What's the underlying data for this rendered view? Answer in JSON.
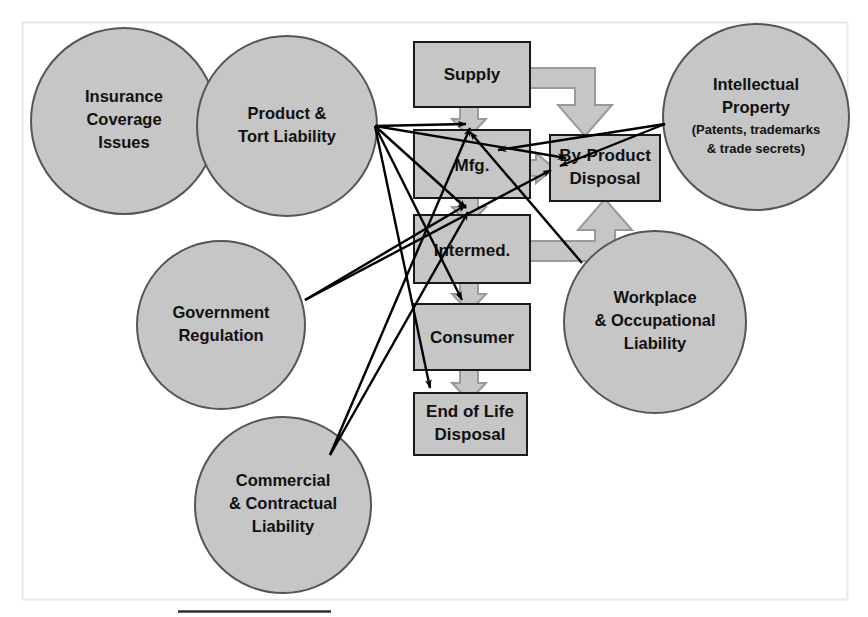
{
  "diagram": {
    "colors": {
      "shape_fill": "#c6c6c6",
      "shape_stroke": "#4d4d4d",
      "box_stroke": "#1a1a1a",
      "arrow_fill": "#c6c6c6",
      "arrow_stroke": "#8c8c8c",
      "line_stroke": "#000000",
      "frame_stroke": "#e4e4e4",
      "background": "#ffffff",
      "text": "#111111"
    },
    "frame": {
      "x": 22,
      "y": 22,
      "width": 826,
      "height": 578
    },
    "footer_rule": {
      "x1": 178,
      "y1": 612,
      "x2": 331,
      "y2": 612
    },
    "circles": [
      {
        "id": "insurance-coverage-issues",
        "lines": [
          "Insurance",
          "Coverage",
          "Issues"
        ],
        "cx": 124,
        "cy": 121,
        "r": 93
      },
      {
        "id": "product-tort-liability",
        "lines": [
          "Product &",
          "Tort Liability"
        ],
        "cx": 287,
        "cy": 126,
        "r": 90
      },
      {
        "id": "intellectual-property",
        "lines": [
          "Intellectual",
          "Property"
        ],
        "sub_lines": [
          "(Patents, trademarks",
          "& trade secrets)"
        ],
        "cx": 756,
        "cy": 117,
        "r": 93
      },
      {
        "id": "government-regulation",
        "lines": [
          "Government",
          "Regulation"
        ],
        "cx": 221,
        "cy": 325,
        "r": 84
      },
      {
        "id": "workplace-occupational-liability",
        "lines": [
          "Workplace",
          "& Occupational",
          "Liability"
        ],
        "cx": 655,
        "cy": 322,
        "r": 91
      },
      {
        "id": "commercial-contractual-liability",
        "lines": [
          "Commercial",
          "& Contractual",
          "Liability"
        ],
        "cx": 283,
        "cy": 505,
        "r": 88
      }
    ],
    "boxes": [
      {
        "id": "supply",
        "lines": [
          "Supply"
        ],
        "x": 414,
        "y": 42,
        "width": 116,
        "height": 65
      },
      {
        "id": "mfg",
        "lines": [
          "Mfg."
        ],
        "x": 414,
        "y": 130,
        "width": 116,
        "height": 68
      },
      {
        "id": "intermed",
        "lines": [
          "Intermed."
        ],
        "x": 414,
        "y": 215,
        "width": 116,
        "height": 68
      },
      {
        "id": "consumer",
        "lines": [
          "Consumer"
        ],
        "x": 414,
        "y": 304,
        "width": 116,
        "height": 66
      },
      {
        "id": "end-of-life",
        "lines": [
          "End of Life",
          "Disposal"
        ],
        "x": 414,
        "y": 393,
        "width": 113,
        "height": 62
      },
      {
        "id": "by-product",
        "lines": [
          "By-Product",
          "Disposal"
        ],
        "x": 550,
        "y": 135,
        "width": 110,
        "height": 66
      }
    ],
    "flow_arrows": [
      {
        "id": "supply-to-mfg",
        "from": "supply",
        "to": "mfg",
        "kind": "down"
      },
      {
        "id": "mfg-to-intermed",
        "from": "mfg",
        "to": "intermed",
        "kind": "down"
      },
      {
        "id": "intermed-to-consumer",
        "from": "intermed",
        "to": "consumer",
        "kind": "down"
      },
      {
        "id": "consumer-to-eol",
        "from": "consumer",
        "to": "end-of-life",
        "kind": "down"
      },
      {
        "id": "mfg-to-byproduct",
        "from": "mfg",
        "to": "by-product",
        "kind": "right"
      },
      {
        "id": "supply-to-byproduct",
        "from": "supply",
        "to": "by-product",
        "kind": "elbow-down"
      },
      {
        "id": "intermed-to-byproduct",
        "from": "intermed",
        "to": "by-product",
        "kind": "elbow-up"
      }
    ],
    "relation_lines": [
      {
        "from": "product-tort-liability",
        "to": "mfg"
      },
      {
        "from": "product-tort-liability",
        "to": "intermed"
      },
      {
        "from": "product-tort-liability",
        "to": "consumer"
      },
      {
        "from": "product-tort-liability",
        "to": "end-of-life"
      },
      {
        "from": "product-tort-liability",
        "to": "by-product"
      },
      {
        "from": "intellectual-property",
        "to": "mfg"
      },
      {
        "from": "intellectual-property",
        "to": "by-product"
      },
      {
        "from": "government-regulation",
        "to": "mfg"
      },
      {
        "from": "government-regulation",
        "to": "by-product"
      },
      {
        "from": "workplace-occupational-liability",
        "to": "mfg"
      },
      {
        "from": "commercial-contractual-liability",
        "to": "mfg"
      },
      {
        "from": "commercial-contractual-liability",
        "to": "intermed"
      }
    ]
  }
}
